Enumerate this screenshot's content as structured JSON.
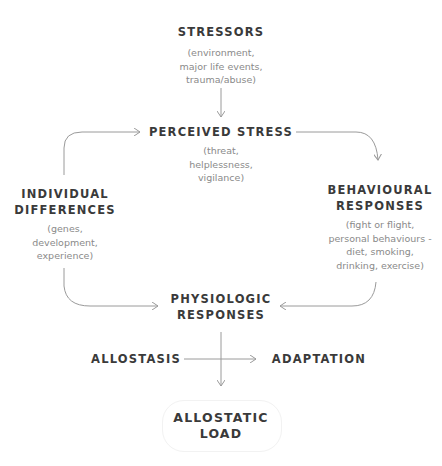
{
  "diagram": {
    "nodes": {
      "stressors": {
        "title": "STRESSORS",
        "lines": [
          "(environment,",
          "major life events,",
          "trauma/abuse)"
        ]
      },
      "perceived_stress": {
        "title": "PERCEIVED STRESS",
        "lines": [
          "(threat,",
          "helplessness,",
          "vigilance)"
        ]
      },
      "individual_differences": {
        "title_lines": [
          "INDIVIDUAL",
          "DIFFERENCES"
        ],
        "lines": [
          "(genes,",
          "development,",
          "experience)"
        ]
      },
      "behavioural_responses": {
        "title_lines": [
          "BEHAVIOURAL",
          "RESPONSES"
        ],
        "lines": [
          "(fight or flight,",
          "personal behaviours -",
          "diet, smoking,",
          "drinking, exercise)"
        ]
      },
      "physiologic_responses": {
        "title_lines": [
          "PHYSIOLOGIC",
          "RESPONSES"
        ]
      },
      "allostasis": {
        "title": "ALLOSTASIS"
      },
      "adaptation": {
        "title": "ADAPTATION"
      },
      "allostatic_load": {
        "title_lines": [
          "ALLOSTATIC",
          "LOAD"
        ]
      }
    },
    "colors": {
      "title": "#3a3a3a",
      "subtitle": "#8a8a8a",
      "arrow": "#9a9a9a"
    }
  }
}
